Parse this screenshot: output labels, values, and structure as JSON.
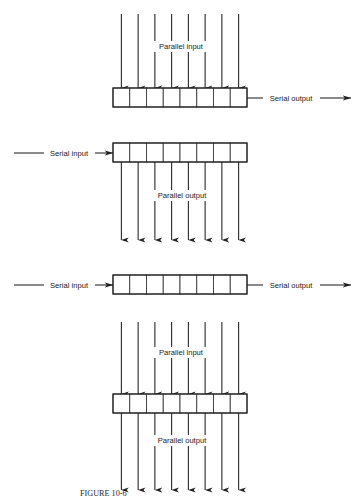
{
  "figure": {
    "caption": "FIGURE 10-6",
    "caption_visible_partial": true,
    "background_color": "#ffffff",
    "line_color": "#1f1f1f",
    "text_color": "#1a1a1a"
  },
  "register": {
    "cell_count": 8,
    "box_left": 113,
    "box_right": 247,
    "box_width": 134,
    "cell_width": 16.75,
    "box_height": 19
  },
  "diagrams": [
    {
      "id": "parallel-in-serial-out",
      "name": "Parallel in / serial out shift register",
      "box_top": 88,
      "top_arrows": {
        "present": true,
        "count": 8,
        "start_y": 14,
        "end_y": 88,
        "direction": "down",
        "label": "Parallel input",
        "label_x": 181,
        "label_y": 49
      },
      "bottom_arrows": {
        "present": false
      },
      "left_lead": {
        "present": false
      },
      "right_lead": {
        "present": true,
        "label": "Serial output",
        "label_x": 291,
        "line_y": 98,
        "x_start": 247,
        "x_end": 351,
        "direction": "right"
      }
    },
    {
      "id": "serial-in-parallel-out",
      "name": "Serial in / parallel out shift register",
      "box_top": 143,
      "top_arrows": {
        "present": false
      },
      "bottom_arrows": {
        "present": true,
        "count": 8,
        "start_y": 162,
        "end_y": 240,
        "direction": "down",
        "label": "Parallel output",
        "label_x": 182,
        "label_y": 198
      },
      "left_lead": {
        "present": true,
        "label": "Serial input",
        "label_x": 69,
        "line_y": 153,
        "x_start": 14,
        "x_end": 113,
        "direction": "right"
      },
      "right_lead": {
        "present": false
      }
    },
    {
      "id": "serial-in-serial-out",
      "name": "Serial in / serial out shift register",
      "box_top": 275,
      "top_arrows": {
        "present": false
      },
      "bottom_arrows": {
        "present": false
      },
      "left_lead": {
        "present": true,
        "label": "Serial input",
        "label_x": 69,
        "line_y": 285,
        "x_start": 14,
        "x_end": 113,
        "direction": "right"
      },
      "right_lead": {
        "present": true,
        "label": "Serial output",
        "label_x": 291,
        "line_y": 285,
        "x_start": 247,
        "x_end": 351,
        "direction": "right"
      }
    },
    {
      "id": "parallel-in-parallel-out",
      "name": "Parallel in / parallel out shift register",
      "box_top": 394,
      "top_arrows": {
        "present": true,
        "count": 8,
        "start_y": 322,
        "end_y": 394,
        "direction": "down",
        "label": "Parallel input",
        "label_x": 181,
        "label_y": 355
      },
      "bottom_arrows": {
        "present": true,
        "count": 8,
        "start_y": 413,
        "end_y": 490,
        "direction": "down",
        "label": "Parallel output",
        "label_x": 182,
        "label_y": 443
      },
      "left_lead": {
        "present": false
      },
      "right_lead": {
        "present": false
      }
    }
  ],
  "labels": {
    "parallel_input": "Parallel input",
    "parallel_output": "Parallel output",
    "serial_input": "Serial input",
    "serial_output": "Serial output"
  }
}
